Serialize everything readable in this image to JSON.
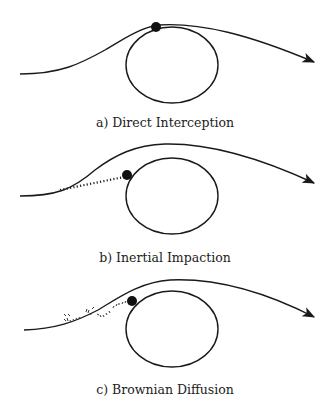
{
  "figure": {
    "panels": [
      {
        "id": "a",
        "caption": "a) Direct Interception",
        "mechanism": "direct-interception"
      },
      {
        "id": "b",
        "caption": "b) Inertial Impaction",
        "mechanism": "inertial-impaction"
      },
      {
        "id": "c",
        "caption": "c) Brownian Diffusion",
        "mechanism": "brownian-diffusion"
      }
    ],
    "colors": {
      "ink": "#1a1a1a",
      "background": "#ffffff"
    }
  }
}
